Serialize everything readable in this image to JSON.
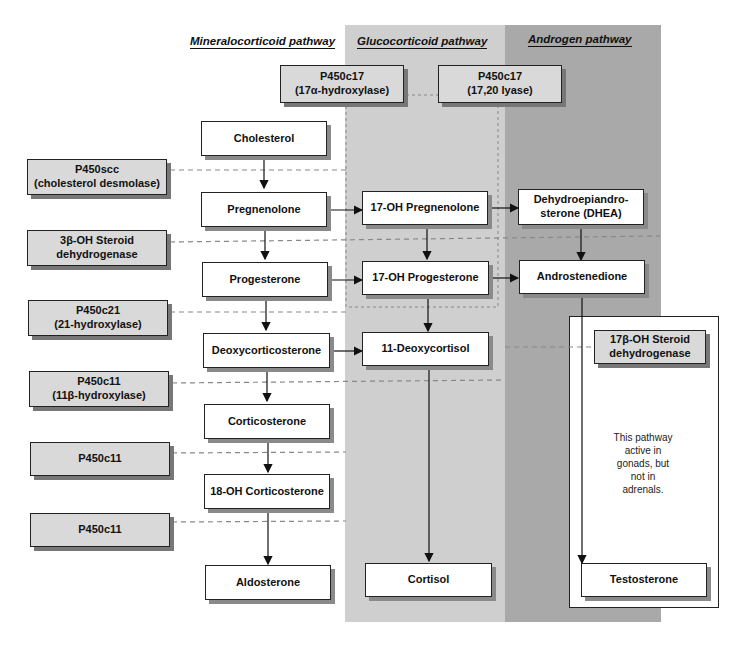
{
  "diagram": {
    "columns": [
      {
        "id": "mineralocorticoid",
        "label": "Mineralocorticoid pathway"
      },
      {
        "id": "glucocorticoid",
        "label": "Glucocorticoid pathway"
      },
      {
        "id": "androgen",
        "label": "Androgen pathway"
      }
    ],
    "enzymes_top": [
      {
        "id": "p450c17-hydroxylase",
        "label": "P450c17\n(17α-hydroxylase)"
      },
      {
        "id": "p450c17-lyase",
        "label": "P450c17\n(17,20 lyase)"
      }
    ],
    "enzymes_left": [
      {
        "id": "p450scc",
        "label": "P450scc\n(cholesterol desmolase)"
      },
      {
        "id": "3b-hsd",
        "label": "3β-OH Steroid\ndehydrogenase"
      },
      {
        "id": "p450c21",
        "label": "P450c21\n(21-hydroxylase)"
      },
      {
        "id": "p450c11-a",
        "label": "P450c11\n(11β-hydroxylase)"
      },
      {
        "id": "p450c11-b",
        "label": "P450c11"
      },
      {
        "id": "p450c11-c",
        "label": "P450c11"
      }
    ],
    "enzyme_gonad": {
      "id": "17b-hsd",
      "label": "17β-OH Steroid\ndehydrogenase"
    },
    "nodes": {
      "cholesterol": "Cholesterol",
      "pregnenolone": "Pregnenolone",
      "progesterone": "Progesterone",
      "deoxycorticosterone": "Deoxycorticosterone",
      "corticosterone": "Corticosterone",
      "oh18_corticosterone": "18-OH Corticosterone",
      "aldosterone": "Aldosterone",
      "oh17_pregnenolone": "17-OH Pregnenolone",
      "oh17_progesterone": "17-OH Progesterone",
      "deoxycortisol": "11-Deoxycortisol",
      "cortisol": "Cortisol",
      "dhea": "Dehydroepiandro-\nsterone (DHEA)",
      "androstenedione": "Androstenedione",
      "testosterone": "Testosterone"
    },
    "note": "This pathway\nactive in\ngonads, but\nnot in\nadrenals.",
    "colors": {
      "glucocorticoid_bg": "#cfcfcf",
      "androgen_bg": "#a9a9a9",
      "enzyme_box": "#d9d9d9",
      "node_box": "#ffffff"
    }
  }
}
